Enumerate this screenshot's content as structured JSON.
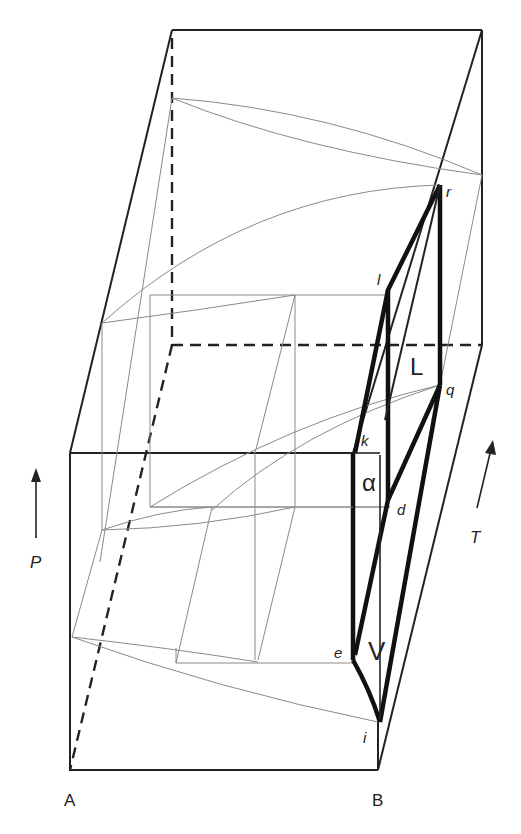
{
  "diagram": {
    "type": "3D P-T-X phase diagram (binary system, prism)",
    "components": {
      "left": "A",
      "right": "B"
    },
    "axes": {
      "pressure": {
        "label": "P",
        "direction": "up"
      },
      "temperature": {
        "label": "T",
        "direction": "into page / up-right"
      }
    },
    "phase_labels": {
      "alpha": "α",
      "liquid": "L",
      "vapor": "V"
    },
    "points": {
      "r": "r",
      "l": "l",
      "q": "q",
      "k": "k",
      "d": "d",
      "e": "e",
      "i": "i"
    },
    "colors": {
      "heavy_lines": "#111111",
      "box_edges": "#222222",
      "thin_curves": "#8a8a8a",
      "background": "#ffffff"
    }
  }
}
